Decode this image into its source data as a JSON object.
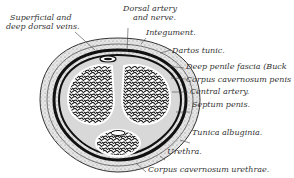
{
  "diagram": {
    "labels": {
      "superficial_veins": [
        "Superficial and",
        "deep dorsal veins."
      ],
      "dorsal_artery": [
        "Dorsal artery",
        "and nerve."
      ],
      "integument": "Integument.",
      "dartos": "Dartos tunic.",
      "buck": "Deep penile fascia (Buck",
      "cc_penis": "Corpus cavernosum penis",
      "central_artery": "Central artery.",
      "septum": "Septum penis.",
      "tunica": "Tunica albuginia.",
      "urethra": "Urethra.",
      "cc_urethrae": "Corpus cavernosum urethrae."
    }
  }
}
